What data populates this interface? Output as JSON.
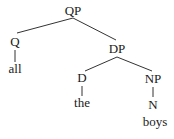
{
  "tree": {
    "nodes": {
      "qp": {
        "label": "QP",
        "x": 73,
        "y": 15
      },
      "q": {
        "label": "Q",
        "x": 15,
        "y": 46
      },
      "all": {
        "label": "all",
        "x": 15,
        "y": 73
      },
      "dp": {
        "label": "DP",
        "x": 117,
        "y": 53
      },
      "d": {
        "label": "D",
        "x": 82,
        "y": 82
      },
      "the": {
        "label": "the",
        "x": 82,
        "y": 107
      },
      "np": {
        "label": "NP",
        "x": 153,
        "y": 83
      },
      "n": {
        "label": "N",
        "x": 153,
        "y": 109
      },
      "boys": {
        "label": "boys",
        "x": 155,
        "y": 126
      }
    },
    "edges": [
      {
        "from": "QP",
        "to": "Q"
      },
      {
        "from": "QP",
        "to": "DP"
      },
      {
        "from": "Q",
        "to": "all"
      },
      {
        "from": "DP",
        "to": "D"
      },
      {
        "from": "DP",
        "to": "NP"
      },
      {
        "from": "D",
        "to": "the"
      },
      {
        "from": "NP",
        "to": "N"
      },
      {
        "from": "N",
        "to": "boys"
      }
    ]
  }
}
